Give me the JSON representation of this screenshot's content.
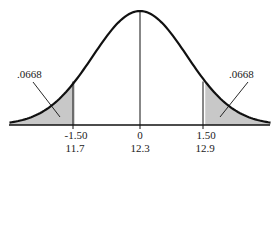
{
  "chart_data": {
    "type": "area",
    "title": "",
    "xlabel": "",
    "ylabel": "",
    "grid": false,
    "legend": null,
    "x_ticks": [
      {
        "z": "-1.50",
        "value": "11.7"
      },
      {
        "z": "0",
        "value": "12.3"
      },
      {
        "z": "1.50",
        "value": "12.9"
      }
    ],
    "shaded_regions": [
      {
        "side": "left",
        "from_z": null,
        "to_z": -1.5,
        "area": ".0668"
      },
      {
        "side": "right",
        "from_z": 1.5,
        "to_z": null,
        "area": ".0668"
      }
    ],
    "mean": 12.3,
    "z_cutoffs": [
      -1.5,
      1.5
    ],
    "xlim_z": [
      -3.0,
      3.0
    ],
    "colors": {
      "curve": "#111111",
      "shade": "#c8c8c8",
      "axis": "#111111"
    }
  },
  "labels": {
    "left_area": ".0668",
    "right_area": ".0668",
    "left_z": "-1.50",
    "center_z": "0",
    "right_z": "1.50",
    "left_value": "11.7",
    "center_value": "12.3",
    "right_value": "12.9"
  }
}
